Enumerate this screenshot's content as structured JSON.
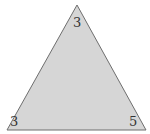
{
  "diagram": {
    "type": "triangle",
    "fill_color": "#d6d6d6",
    "stroke_color": "#6e6e6e",
    "vertices": {
      "top": {
        "x": 77,
        "y": 5
      },
      "bottom_left": {
        "x": 7,
        "y": 130
      },
      "bottom_right": {
        "x": 146,
        "y": 130
      }
    },
    "labels": {
      "top": "3",
      "bottom_left": "3",
      "bottom_right": "5"
    }
  }
}
